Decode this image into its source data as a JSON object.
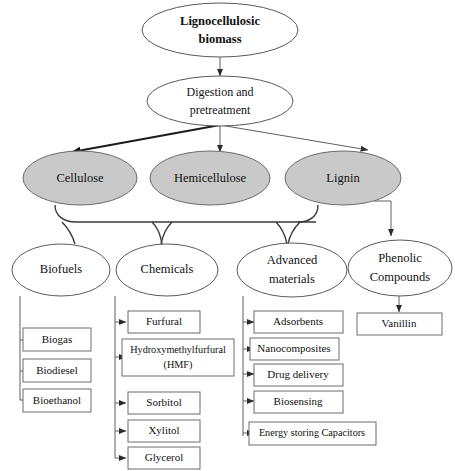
{
  "diagram": {
    "colors": {
      "fraction_fill": "#c9c9c9",
      "node_fill": "#ffffff",
      "stroke": "#5f5f5f",
      "text": "#111111"
    },
    "root": {
      "label_line1": "Lignocellulosic",
      "label_line2": "biomass"
    },
    "process": {
      "label_line1": "Digestion and",
      "label_line2": "pretreatment"
    },
    "fractions": [
      {
        "id": "cellulose",
        "label": "Cellulose"
      },
      {
        "id": "hemicellulose",
        "label": "Hemicellulose"
      },
      {
        "id": "lignin",
        "label": "Lignin"
      }
    ],
    "categories": [
      {
        "id": "biofuels",
        "label_line1": "Biofuels",
        "label_line2": ""
      },
      {
        "id": "chemicals",
        "label_line1": "Chemicals",
        "label_line2": ""
      },
      {
        "id": "advanced-materials",
        "label_line1": "Advanced",
        "label_line2": "materials"
      },
      {
        "id": "phenolic-compounds",
        "label_line1": "Phenolic",
        "label_line2": "Compounds"
      }
    ],
    "products": {
      "biofuels": [
        {
          "label": "Biogas"
        },
        {
          "label": "Biodiesel"
        },
        {
          "label": "Bioethanol"
        }
      ],
      "chemicals": [
        {
          "label": "Furfural"
        },
        {
          "label_line1": "Hydroxymethylfurfural",
          "label_line2": "(HMF)"
        },
        {
          "label": "Sorbitol"
        },
        {
          "label": "Xylitol"
        },
        {
          "label": "Glycerol"
        }
      ],
      "advanced_materials": [
        {
          "label": "Adsorbents"
        },
        {
          "label": "Nanocomposites"
        },
        {
          "label": "Drug delivery"
        },
        {
          "label": "Biosensing"
        },
        {
          "label": "Energy storing Capacitors"
        }
      ],
      "phenolic_compounds": [
        {
          "label": "Vanillin"
        }
      ]
    }
  }
}
